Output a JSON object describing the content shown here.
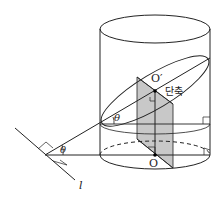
{
  "diagram": {
    "type": "cylinder-section-geometry",
    "labels": {
      "center_top": "O′",
      "center_bottom": "O",
      "minor_axis": "단축",
      "angle_upper": "θ",
      "angle_lower": "θ",
      "line": "l"
    },
    "colors": {
      "stroke": "#222222",
      "shade": "#c8c8c8",
      "background": "#ffffff"
    }
  }
}
